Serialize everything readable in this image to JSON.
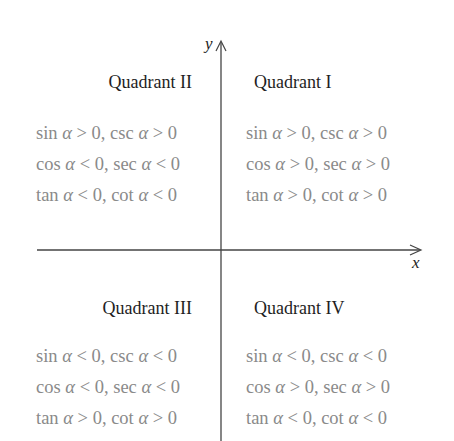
{
  "axes": {
    "x_label": "x",
    "y_label": "y"
  },
  "quadrants": {
    "q2": {
      "title": "Quadrant II",
      "rows": [
        "sin α > 0, csc α > 0",
        "cos α < 0, sec α < 0",
        "tan α < 0, cot α < 0"
      ]
    },
    "q1": {
      "title": "Quadrant I",
      "rows": [
        "sin α > 0, csc α > 0",
        "cos α > 0, sec α > 0",
        "tan α > 0, cot α > 0"
      ]
    },
    "q3": {
      "title": "Quadrant III",
      "rows": [
        "sin α < 0, csc α < 0",
        "cos α < 0, sec α < 0",
        "tan α > 0, cot α > 0"
      ]
    },
    "q4": {
      "title": "Quadrant IV",
      "rows": [
        "sin α < 0, csc α < 0",
        "cos α > 0, sec α > 0",
        "tan α < 0, cot α < 0"
      ]
    }
  },
  "colors": {
    "axis": "#444444",
    "title": "#1e1e1e",
    "row_text": "#8a8a8a"
  }
}
